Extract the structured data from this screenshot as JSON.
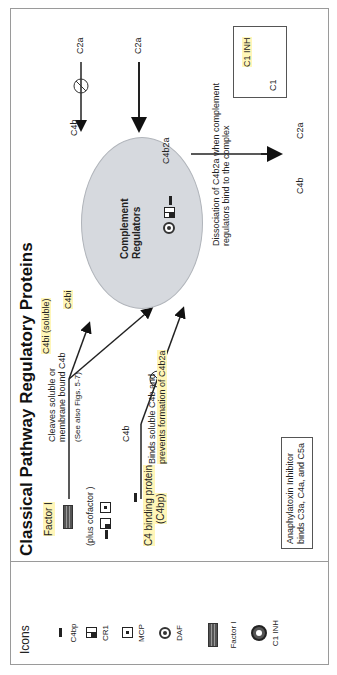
{
  "title": "Classical Pathway Regulatory Proteins",
  "legend": {
    "heading": "Icons",
    "items": [
      {
        "icon": "c4bp-bar-icon",
        "label": "C4bp"
      },
      {
        "icon": "cr1-checker-icon",
        "label": "CR1"
      },
      {
        "icon": "mcp-square-icon",
        "label": "MCP"
      },
      {
        "icon": "daf-ring-icon",
        "label": "DAF"
      },
      {
        "icon": "factor-i-striped-icon",
        "label": "Factor I"
      },
      {
        "icon": "c1-inh-donut-icon",
        "label": "C1 INH"
      }
    ]
  },
  "factor_i_section": {
    "label": "Factor I",
    "cofactor_note": "(plus  cofactor )",
    "action": "Cleaves soluble or membrane bound C4b",
    "action_line1": "Cleaves soluble or",
    "action_line2": "membrane bound C4b",
    "see_also": "(See also Figs. 5-7)",
    "product": "C4bi (soluble)"
  },
  "c4bp_section": {
    "label_line1": "C4 binding protein",
    "label_line2": "(C4bp)",
    "bound": "C4b",
    "action_line1": "Binds soluble C4b and",
    "action_line2": "prevents formation of C4b2a"
  },
  "cell": {
    "label_line1": "Complement",
    "label_line2": "Regulators",
    "surface_c4bi": "C4bi",
    "surface_c4b2a": "C4b2a"
  },
  "top_pathway": {
    "c4b_label": "C4b",
    "c2a_label_1": "C2a",
    "c2a_label_2": "C2a"
  },
  "dissociation": {
    "line1": "Dissociation of C4b2a when complement",
    "line2": "regulators bind to the complex",
    "product_c4b": "C4b",
    "product_c2a": "C2a"
  },
  "c1_box": {
    "c1": "C1",
    "c1_inh": "C1 INH"
  },
  "anaphylatoxin_box": {
    "line1": "Anaphylatoxin Inhibitor",
    "line2": "binds C3a, C4a, and C5a"
  },
  "colors": {
    "highlight": "#fff6b8",
    "cell_fill": "#d6d9de",
    "frame": "#9a9a9a"
  }
}
